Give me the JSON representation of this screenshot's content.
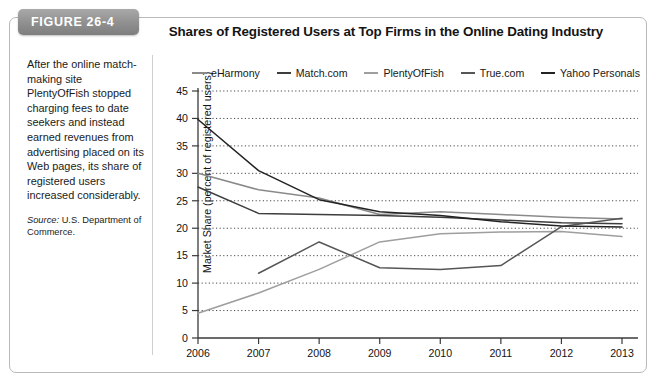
{
  "figure": {
    "badge_label": "FIGURE 26-4",
    "title": "Shares of Registered Users at Top Firms in the Online Dating Industry",
    "caption_body": "After the online match-making site PlentyOfFish stopped charging fees to date seekers and instead earned revenues from advertising placed on its Web pages, its share of registered users increased considerably.",
    "source_prefix": "Source:",
    "source_text": "U.S. Department of Commerce."
  },
  "chart_data": {
    "type": "line",
    "title": "Shares of Registered Users at Top Firms in the Online Dating Industry",
    "xlabel": "",
    "ylabel": "Market Share (percent of registered users)",
    "x": [
      2006,
      2007,
      2008,
      2009,
      2010,
      2011,
      2012,
      2013
    ],
    "xtick_labels": [
      "2006",
      "2007",
      "2008",
      "2009",
      "2010",
      "2011",
      "2012",
      "2013"
    ],
    "ytick_labels": [
      "0",
      "5",
      "10",
      "15",
      "20",
      "25",
      "30",
      "35",
      "40",
      "45"
    ],
    "yticks": [
      0,
      5,
      10,
      15,
      20,
      25,
      30,
      35,
      40,
      45
    ],
    "ylim": [
      0,
      45
    ],
    "xlim": [
      2006,
      2013
    ],
    "grid": true,
    "grid_style": "dotted-horizontal",
    "legend_position": "top",
    "series": [
      {
        "name": "eHarmony",
        "color": "#8a8a8a",
        "x": [
          2006,
          2007,
          2008,
          2009,
          2010,
          2011,
          2012,
          2013
        ],
        "values": [
          30.0,
          27.0,
          25.5,
          22.5,
          23.0,
          22.5,
          22.0,
          21.7
        ]
      },
      {
        "name": "Match.com",
        "color": "#3d3d3d",
        "x": [
          2006,
          2007,
          2008,
          2009,
          2010,
          2011,
          2012,
          2013
        ],
        "values": [
          27.5,
          22.7,
          22.5,
          22.3,
          22.0,
          21.5,
          21.0,
          20.8
        ]
      },
      {
        "name": "PlentyOfFish",
        "color": "#9e9e9e",
        "x": [
          2006,
          2007,
          2008,
          2009,
          2010,
          2011,
          2012,
          2013
        ],
        "values": [
          4.5,
          8.2,
          12.5,
          17.5,
          19.0,
          19.3,
          19.4,
          18.5
        ]
      },
      {
        "name": "True.com",
        "color": "#565656",
        "x": [
          2007,
          2008,
          2009,
          2010,
          2011,
          2012,
          2013
        ],
        "values": [
          11.8,
          17.5,
          12.8,
          12.5,
          13.2,
          20.3,
          21.8
        ]
      },
      {
        "name": "Yahoo Personals",
        "color": "#232323",
        "x": [
          2006,
          2007,
          2008,
          2009,
          2010,
          2011,
          2012,
          2013
        ],
        "values": [
          39.8,
          30.5,
          25.2,
          23.0,
          22.3,
          21.2,
          20.4,
          20.2
        ]
      }
    ]
  }
}
